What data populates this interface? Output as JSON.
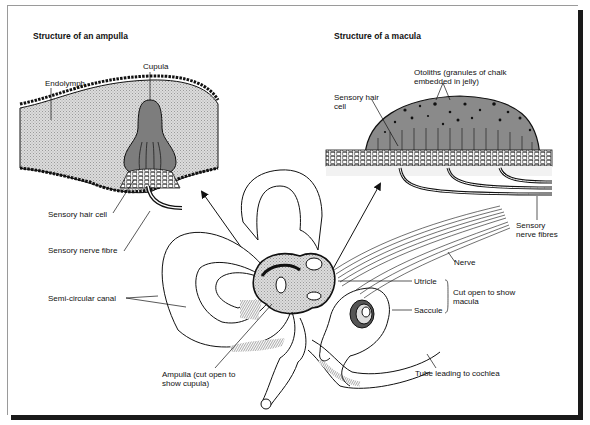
{
  "diagram": {
    "panels": {
      "ampulla": {
        "title": "Structure of an ampulla",
        "labels": {
          "cupula": "Cupula",
          "endolymph": "Endolymph",
          "sensory_hair_cell": "Sensory hair cell",
          "sensory_nerve_fibre": "Sensory nerve fibre"
        }
      },
      "macula": {
        "title": "Structure of a macula",
        "labels": {
          "otoliths_line1": "Otoliths (granules of chalk",
          "otoliths_line2": "embedded in jelly)",
          "sensory_hair_cell_line1": "Sensory hair",
          "sensory_hair_cell_line2": "cell",
          "sensory_nerve_fibres_line1": "Sensory",
          "sensory_nerve_fibres_line2": "nerve fibres"
        }
      }
    },
    "inner_ear": {
      "labels": {
        "semi_circular_canal": "Semi-circular canal",
        "ampulla_line1": "Ampulla (cut open to",
        "ampulla_line2": "show cupula)",
        "nerve": "Nerve",
        "utricle": "Utricle",
        "saccule": "Saccule",
        "cut_open_line1": "Cut open to show",
        "cut_open_line2": "macula",
        "tube_to_cochlea": "Tube leading to cochlea"
      }
    },
    "colors": {
      "stipple_fill": "#cfcfcf",
      "cupula_fill": "#7d7d7d",
      "otolith_fill": "#8a8a8a",
      "line": "#111111",
      "frame_shadow": "#1a1a1a"
    }
  }
}
